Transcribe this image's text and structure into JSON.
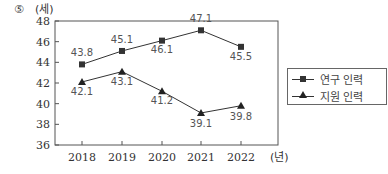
{
  "question_number": "⑤",
  "chart_data": {
    "type": "line",
    "title": "",
    "ylabel": "(세)",
    "xlabel": "(년)",
    "categories": [
      "2018",
      "2019",
      "2020",
      "2021",
      "2022"
    ],
    "ylim": [
      36,
      48
    ],
    "yticks": [
      36,
      38,
      40,
      42,
      44,
      46,
      48
    ],
    "grid": false,
    "legend_position": "right",
    "series": [
      {
        "name": "연구 인력",
        "marker": "square",
        "values": [
          43.8,
          45.1,
          46.1,
          47.1,
          45.5
        ],
        "labels": [
          "43.8",
          "45.1",
          "46.1",
          "47.1",
          "45.5"
        ]
      },
      {
        "name": "지원 인력",
        "marker": "triangle",
        "values": [
          42.1,
          43.1,
          41.2,
          39.1,
          39.8
        ],
        "labels": [
          "42.1",
          "43.1",
          "41.2",
          "39.1",
          "39.8"
        ]
      }
    ]
  },
  "legend": {
    "items": [
      {
        "label": "연구 인력",
        "marker": "square"
      },
      {
        "label": "지원 인력",
        "marker": "triangle"
      }
    ]
  },
  "colors": {
    "line": "#333333",
    "text": "#555555",
    "axis": "#333333"
  }
}
